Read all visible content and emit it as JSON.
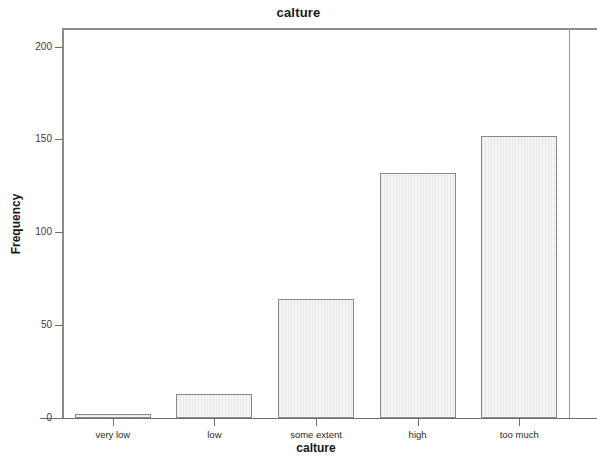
{
  "chart_data": {
    "type": "bar",
    "title": "calture",
    "xlabel": "calture",
    "ylabel": "Frequency",
    "categories": [
      "very low",
      "low",
      "some extent",
      "high",
      "too much"
    ],
    "values": [
      2,
      13,
      64,
      132,
      152
    ],
    "ylim": [
      0,
      210
    ],
    "yticks": [
      0,
      50,
      100,
      150,
      200
    ],
    "ytick_labels": [
      "0",
      "50",
      "100",
      "150",
      "200"
    ],
    "grid": false,
    "legend": false,
    "bar_fill_color": "#e9e9e9",
    "bar_border_color": "#8a8a8a",
    "axis_color": "#8c8c8c",
    "background_color": "#ffffff"
  }
}
